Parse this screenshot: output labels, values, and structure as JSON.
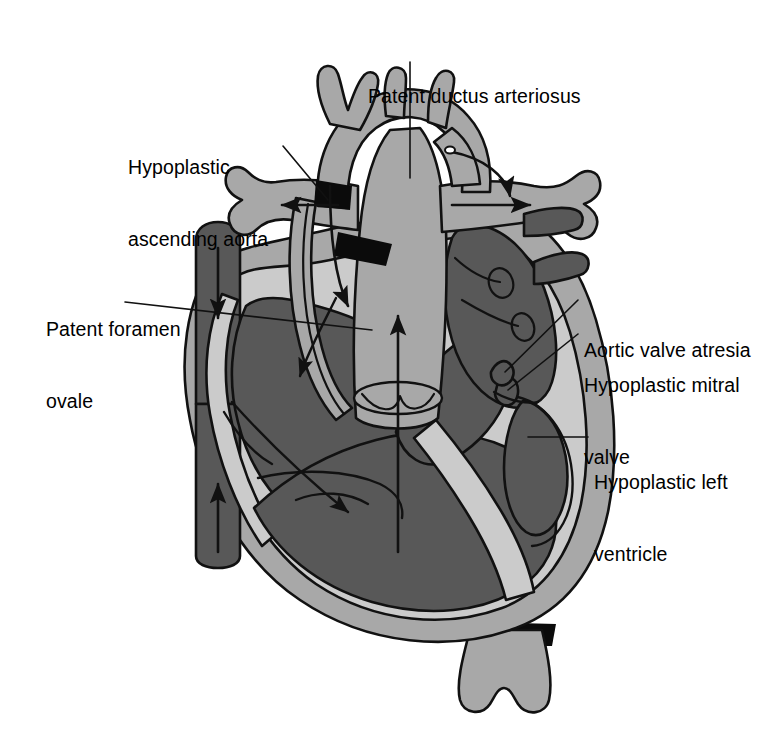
{
  "figure": {
    "background_color": "#ffffff",
    "width": 770,
    "height": 750
  },
  "palette": {
    "outline": "#111111",
    "vessel_gray": "#a8a8a8",
    "chamber_dark": "#585858",
    "myocardium_light": "#cbcbcb",
    "shadow_black": "#0b0b0b",
    "label_color": "#000000",
    "background": "#ffffff"
  },
  "labels": [
    {
      "id": "patent-ductus-arteriosus",
      "text": "Patent ductus arteriosus",
      "lines": [
        "Patent ductus arteriosus"
      ]
    },
    {
      "id": "hypoplastic-ascending-aorta",
      "text": "Hypoplastic ascending aorta",
      "lines": [
        "Hypoplastic",
        "ascending aorta"
      ]
    },
    {
      "id": "patent-foramen-ovale",
      "text": "Patent foramen ovale",
      "lines": [
        "Patent foramen",
        "ovale"
      ]
    },
    {
      "id": "aortic-valve-atresia",
      "text": "Aortic valve atresia",
      "lines": [
        "Aortic valve atresia"
      ]
    },
    {
      "id": "hypoplastic-mitral-valve",
      "text": "Hypoplastic mitral valve",
      "lines": [
        "Hypoplastic mitral",
        "valve"
      ]
    },
    {
      "id": "hypoplastic-left-ventricle",
      "text": "Hypoplastic left ventricle",
      "lines": [
        "Hypoplastic left",
        "ventricle"
      ]
    }
  ],
  "label_lines": {
    "pda_line1": "Patent ductus arteriosus",
    "hyp_aao_line1": "Hypoplastic",
    "hyp_aao_line2": "ascending aorta",
    "pfo_line1": "Patent foramen",
    "pfo_line2": "ovale",
    "ava_line1": "Aortic valve atresia",
    "hmv_line1": "Hypoplastic mitral",
    "hmv_line2": "valve",
    "hlv_line1": "Hypoplastic left",
    "hlv_line2": "ventricle"
  },
  "anatomy_parts": [
    "aortic-arch",
    "hypoplastic-ascending-aorta",
    "patent-ductus-arteriosus",
    "main-pulmonary-artery",
    "right-pulmonary-artery",
    "left-pulmonary-artery",
    "brachiocephalic-branches",
    "superior-vena-cava",
    "inferior-vena-cava",
    "right-atrium",
    "right-ventricle",
    "left-atrium",
    "hypoplastic-left-ventricle",
    "pulmonary-veins",
    "descending-aorta",
    "ventricular-myocardium"
  ],
  "flow_arrows": [
    {
      "id": "svc-inflow-arrow",
      "direction": "down"
    },
    {
      "id": "ivc-inflow-arrow",
      "direction": "up"
    },
    {
      "id": "foramen-ovale-shunt-arrow",
      "direction": "left"
    },
    {
      "id": "right-atrium-to-ventricle-arrow",
      "direction": "down-right"
    },
    {
      "id": "retrograde-arch-flow-arrow",
      "direction": "left"
    },
    {
      "id": "ductal-flow-right-arrow",
      "direction": "right"
    },
    {
      "id": "ductal-curve-arrow",
      "direction": "down-right"
    },
    {
      "id": "ascending-aorta-retrograde-arrow",
      "direction": "down"
    },
    {
      "id": "pulmonary-trunk-outflow-arrow",
      "direction": "up"
    }
  ]
}
